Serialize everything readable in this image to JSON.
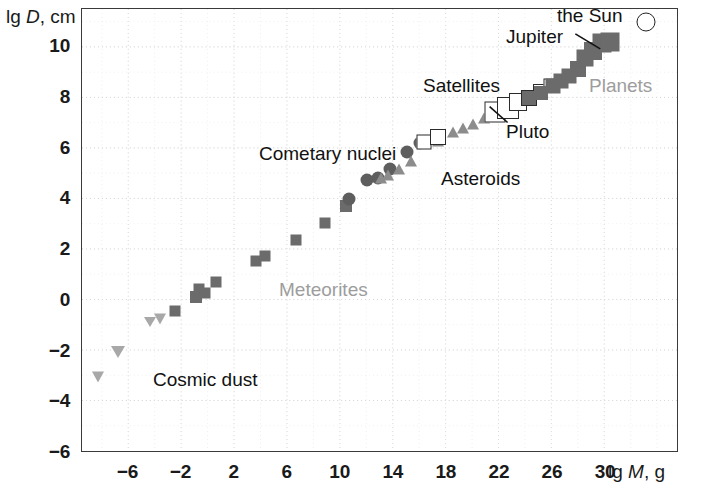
{
  "chart_data": {
    "type": "scatter",
    "title": "",
    "xlabel": "lg M, g",
    "ylabel": "lg D, cm",
    "xlim": [
      -9.5,
      35.5
    ],
    "ylim": [
      -6,
      11.5
    ],
    "xticks": [
      -6,
      -2,
      2,
      6,
      10,
      14,
      18,
      22,
      26,
      30
    ],
    "yticks": [
      10,
      8,
      6,
      4,
      2,
      0,
      -2,
      -4,
      -6
    ],
    "xtick_labels": [
      "−6",
      "−2",
      "2",
      "6",
      "10",
      "14",
      "18",
      "22",
      "26",
      "30"
    ],
    "ytick_labels": [
      "10",
      "8",
      "6",
      "4",
      "2",
      "0",
      "−2",
      "−4",
      "−6"
    ],
    "grid": true,
    "grid_style": "dotted",
    "legend": "none",
    "series": [
      {
        "name": "Cosmic dust",
        "marker": "triangle-down",
        "color": "#a8a8a8",
        "points": [
          {
            "x": -8.3,
            "y": -3.0,
            "size": 13
          },
          {
            "x": -6.8,
            "y": -2.0,
            "size": 14
          },
          {
            "x": -4.4,
            "y": -0.85,
            "size": 12
          },
          {
            "x": -3.6,
            "y": -0.7,
            "size": 13
          }
        ]
      },
      {
        "name": "Meteorites",
        "marker": "square",
        "color": "#6b6b6b",
        "points": [
          {
            "x": -2.5,
            "y": -0.4,
            "size": 11
          },
          {
            "x": -0.9,
            "y": 0.15,
            "size": 12
          },
          {
            "x": -0.7,
            "y": 0.45,
            "size": 11
          },
          {
            "x": -0.2,
            "y": 0.3,
            "size": 11
          },
          {
            "x": 0.6,
            "y": 0.75,
            "size": 11
          },
          {
            "x": 3.6,
            "y": 1.55,
            "size": 11
          },
          {
            "x": 4.3,
            "y": 1.75,
            "size": 11
          },
          {
            "x": 6.6,
            "y": 2.4,
            "size": 11
          },
          {
            "x": 8.8,
            "y": 3.05,
            "size": 11
          },
          {
            "x": 10.4,
            "y": 3.75,
            "size": 12
          }
        ]
      },
      {
        "name": "Cometary nuclei",
        "marker": "circle",
        "color": "#5e5e5e",
        "points": [
          {
            "x": 10.6,
            "y": 4.0,
            "size": 13
          },
          {
            "x": 12.0,
            "y": 4.75,
            "size": 13
          },
          {
            "x": 12.8,
            "y": 4.85,
            "size": 13
          },
          {
            "x": 13.7,
            "y": 5.2,
            "size": 13
          },
          {
            "x": 15.0,
            "y": 5.85,
            "size": 13
          },
          {
            "x": 16.0,
            "y": 6.2,
            "size": 13
          }
        ]
      },
      {
        "name": "Asteroids",
        "marker": "triangle-up",
        "color": "#8c8c8c",
        "points": [
          {
            "x": 13.0,
            "y": 4.85,
            "size": 13
          },
          {
            "x": 13.6,
            "y": 4.95,
            "size": 13
          },
          {
            "x": 14.4,
            "y": 5.2,
            "size": 13
          },
          {
            "x": 15.3,
            "y": 5.5,
            "size": 13
          },
          {
            "x": 17.3,
            "y": 6.3,
            "size": 13
          },
          {
            "x": 18.5,
            "y": 6.65,
            "size": 13
          },
          {
            "x": 19.2,
            "y": 6.8,
            "size": 13
          },
          {
            "x": 20.0,
            "y": 6.95,
            "size": 13
          },
          {
            "x": 20.8,
            "y": 7.2,
            "size": 13
          },
          {
            "x": 21.6,
            "y": 7.45,
            "size": 13
          }
        ]
      },
      {
        "name": "Satellites",
        "marker": "open-square",
        "color": "#2b2b2b",
        "points": [
          {
            "x": 16.3,
            "y": 6.25,
            "size": 15
          },
          {
            "x": 17.3,
            "y": 6.45,
            "size": 16
          },
          {
            "x": 21.6,
            "y": 7.45,
            "size": 21
          },
          {
            "x": 22.6,
            "y": 7.6,
            "size": 22
          },
          {
            "x": 23.4,
            "y": 7.85,
            "size": 18
          },
          {
            "x": 24.2,
            "y": 8.0,
            "size": 16
          },
          {
            "x": 25.0,
            "y": 8.25,
            "size": 14
          },
          {
            "x": 25.8,
            "y": 8.5,
            "size": 13
          }
        ]
      },
      {
        "name": "Planets",
        "marker": "square",
        "color": "#6b6b6b",
        "points": [
          {
            "x": 24.2,
            "y": 8.0,
            "size": 14
          },
          {
            "x": 25.1,
            "y": 8.2,
            "size": 14
          },
          {
            "x": 26.0,
            "y": 8.45,
            "size": 15
          },
          {
            "x": 26.6,
            "y": 8.65,
            "size": 15
          },
          {
            "x": 27.2,
            "y": 8.85,
            "size": 15
          },
          {
            "x": 27.9,
            "y": 9.15,
            "size": 16
          },
          {
            "x": 28.4,
            "y": 9.55,
            "size": 17
          },
          {
            "x": 29.0,
            "y": 9.85,
            "size": 18
          },
          {
            "x": 29.7,
            "y": 10.15,
            "size": 19
          },
          {
            "x": 30.3,
            "y": 10.2,
            "size": 19
          }
        ]
      },
      {
        "name": "the Sun",
        "marker": "open-circle",
        "color": "#222222",
        "points": [
          {
            "x": 33.0,
            "y": 11.0,
            "size": 19
          }
        ]
      }
    ],
    "annotations": [
      {
        "id": "the-sun",
        "text": "the Sun",
        "style": "dark"
      },
      {
        "id": "jupiter",
        "text": "Jupiter",
        "style": "dark",
        "leader": true
      },
      {
        "id": "satellites",
        "text": "Satellites",
        "style": "dark"
      },
      {
        "id": "planets",
        "text": "Planets",
        "style": "faded"
      },
      {
        "id": "pluto",
        "text": "Pluto",
        "style": "dark",
        "leader": true
      },
      {
        "id": "cometary-nuclei",
        "text": "Cometary nuclei",
        "style": "dark"
      },
      {
        "id": "asteroids",
        "text": "Asteroids",
        "style": "dark"
      },
      {
        "id": "meteorites",
        "text": "Meteorites",
        "style": "faded"
      },
      {
        "id": "cosmic-dust",
        "text": "Cosmic dust",
        "style": "dark"
      }
    ]
  },
  "axes": {
    "y_title_prefix": "lg ",
    "y_title_italic": "D",
    "y_title_suffix": ", cm",
    "x_title_prefix": "lg ",
    "x_title_italic": "M",
    "x_title_suffix": ", g"
  },
  "colors": {
    "frame": "#3a3a3a",
    "grid": "#d8d8d8",
    "marker_dark": "#6b6b6b",
    "marker_mid": "#8c8c8c",
    "marker_light": "#a8a8a8",
    "marker_circle": "#5e5e5e",
    "outline": "#2b2b2b",
    "label_dark": "#111111",
    "label_faded": "#9d9d9d"
  },
  "annotation_text": {
    "the_sun": "the Sun",
    "jupiter": "Jupiter",
    "satellites": "Satellites",
    "planets": "Planets",
    "pluto": "Pluto",
    "cometary_nuclei": "Cometary nuclei",
    "asteroids": "Asteroids",
    "meteorites": "Meteorites",
    "cosmic_dust": "Cosmic dust"
  }
}
